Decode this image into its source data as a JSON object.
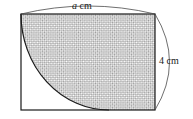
{
  "figure": {
    "background_color": "#ffffff",
    "stroke_color": "#1a1a1a",
    "hatch_color": "#8c8c8c",
    "hatch_fill": "#d9d9d9",
    "unshaded_fill": "#ffffff"
  },
  "labels": {
    "width": {
      "symbol": "a",
      "unit": "cm",
      "text": "a cm",
      "position": "top"
    },
    "height": {
      "symbol": "4",
      "unit": "cm",
      "text": "4 cm",
      "position": "right"
    }
  },
  "shapes": {
    "rectangle": {
      "name": "outer-rectangle",
      "x": 21,
      "y": 14,
      "width": 134,
      "height": 96
    },
    "quarter_circle": {
      "name": "quarter-circle-cutout",
      "center_x": 21,
      "center_y": 14,
      "radius_x": 88,
      "radius_y": 96,
      "fill": "white"
    },
    "shaded_region": {
      "name": "shaded-region",
      "description": "rectangle minus quarter circle",
      "pattern": "cross-hatch"
    }
  },
  "dimension_lines": {
    "top": {
      "name": "top-dimension-arc",
      "from_x": 21,
      "from_y": 14,
      "to_x": 155,
      "to_y": 14,
      "bow": -12
    },
    "right": {
      "name": "right-dimension-arc",
      "from_x": 155,
      "from_y": 14,
      "to_x": 155,
      "to_y": 110,
      "bow": 16
    }
  }
}
